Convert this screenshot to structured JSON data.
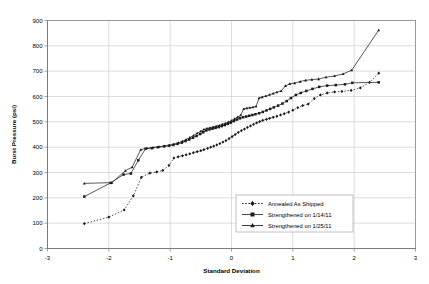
{
  "chart_data": {
    "type": "line",
    "title": "",
    "xlabel": "Standard Deviation",
    "ylabel": "Burst Pressure (psi)",
    "xlim": [
      -3,
      3
    ],
    "ylim": [
      0,
      900
    ],
    "xticks": [
      -3,
      -2,
      -1,
      0,
      1,
      2,
      3
    ],
    "yticks": [
      0,
      100,
      200,
      300,
      400,
      500,
      600,
      700,
      800,
      900
    ],
    "grid": true,
    "legend_position": "lower-center-right",
    "series": [
      {
        "name": "Annealed As Shipped",
        "marker": "diamond",
        "linestyle": "dotted",
        "color": "#1a1a1a",
        "points": [
          [
            -2.4,
            98
          ],
          [
            -2.0,
            124
          ],
          [
            -1.75,
            152
          ],
          [
            -1.6,
            208
          ],
          [
            -1.47,
            281
          ],
          [
            -1.33,
            298
          ],
          [
            -1.22,
            302
          ],
          [
            -1.12,
            308
          ],
          [
            -1.02,
            328
          ],
          [
            -0.94,
            357
          ],
          [
            -0.87,
            362
          ],
          [
            -0.8,
            366
          ],
          [
            -0.74,
            370
          ],
          [
            -0.68,
            374
          ],
          [
            -0.62,
            378
          ],
          [
            -0.56,
            382
          ],
          [
            -0.5,
            386
          ],
          [
            -0.45,
            390
          ],
          [
            -0.39,
            395
          ],
          [
            -0.34,
            400
          ],
          [
            -0.29,
            404
          ],
          [
            -0.24,
            409
          ],
          [
            -0.19,
            414
          ],
          [
            -0.14,
            420
          ],
          [
            -0.09,
            426
          ],
          [
            -0.04,
            434
          ],
          [
            0.01,
            442
          ],
          [
            0.06,
            450
          ],
          [
            0.11,
            458
          ],
          [
            0.16,
            465
          ],
          [
            0.21,
            471
          ],
          [
            0.26,
            478
          ],
          [
            0.31,
            484
          ],
          [
            0.36,
            490
          ],
          [
            0.41,
            496
          ],
          [
            0.46,
            501
          ],
          [
            0.51,
            506
          ],
          [
            0.57,
            510
          ],
          [
            0.62,
            514
          ],
          [
            0.68,
            518
          ],
          [
            0.74,
            522
          ],
          [
            0.8,
            527
          ],
          [
            0.86,
            532
          ],
          [
            0.93,
            538
          ],
          [
            1.0,
            546
          ],
          [
            1.08,
            556
          ],
          [
            1.16,
            564
          ],
          [
            1.25,
            570
          ],
          [
            1.35,
            592
          ],
          [
            1.45,
            606
          ],
          [
            1.56,
            614
          ],
          [
            1.68,
            618
          ],
          [
            1.8,
            620
          ],
          [
            1.95,
            624
          ],
          [
            2.1,
            634
          ],
          [
            2.25,
            656
          ],
          [
            2.4,
            692
          ]
        ]
      },
      {
        "name": "Strengthened on 1/14/11",
        "marker": "square",
        "linestyle": "solid",
        "color": "#3a3a3a",
        "points": [
          [
            -2.4,
            205
          ],
          [
            -1.97,
            259
          ],
          [
            -1.76,
            292
          ],
          [
            -1.64,
            296
          ],
          [
            -1.52,
            348
          ],
          [
            -1.4,
            394
          ],
          [
            -1.3,
            396
          ],
          [
            -1.2,
            400
          ],
          [
            -1.1,
            403
          ],
          [
            -1.02,
            406
          ],
          [
            -0.95,
            409
          ],
          [
            -0.88,
            413
          ],
          [
            -0.81,
            418
          ],
          [
            -0.75,
            424
          ],
          [
            -0.69,
            430
          ],
          [
            -0.63,
            437
          ],
          [
            -0.57,
            444
          ],
          [
            -0.51,
            452
          ],
          [
            -0.46,
            459
          ],
          [
            -0.41,
            466
          ],
          [
            -0.36,
            470
          ],
          [
            -0.31,
            473
          ],
          [
            -0.26,
            476
          ],
          [
            -0.21,
            479
          ],
          [
            -0.16,
            483
          ],
          [
            -0.11,
            487
          ],
          [
            -0.06,
            492
          ],
          [
            -0.01,
            497
          ],
          [
            0.04,
            503
          ],
          [
            0.09,
            509
          ],
          [
            0.14,
            514
          ],
          [
            0.19,
            518
          ],
          [
            0.24,
            521
          ],
          [
            0.29,
            524
          ],
          [
            0.34,
            527
          ],
          [
            0.39,
            530
          ],
          [
            0.45,
            534
          ],
          [
            0.51,
            539
          ],
          [
            0.57,
            545
          ],
          [
            0.63,
            551
          ],
          [
            0.69,
            557
          ],
          [
            0.76,
            564
          ],
          [
            0.83,
            572
          ],
          [
            0.9,
            582
          ],
          [
            0.97,
            594
          ],
          [
            1.05,
            606
          ],
          [
            1.13,
            614
          ],
          [
            1.22,
            622
          ],
          [
            1.32,
            630
          ],
          [
            1.43,
            638
          ],
          [
            1.56,
            643
          ],
          [
            1.7,
            645
          ],
          [
            1.85,
            648
          ],
          [
            1.97,
            654
          ],
          [
            2.4,
            656
          ]
        ]
      },
      {
        "name": "Strengthened on 1/25/11",
        "marker": "triangle",
        "linestyle": "solid",
        "color": "#2a2a2a",
        "points": [
          [
            -2.4,
            257
          ],
          [
            -1.95,
            260
          ],
          [
            -1.73,
            307
          ],
          [
            -1.62,
            321
          ],
          [
            -1.48,
            390
          ],
          [
            -1.38,
            396
          ],
          [
            -1.28,
            399
          ],
          [
            -1.18,
            402
          ],
          [
            -1.09,
            405
          ],
          [
            -1.01,
            408
          ],
          [
            -0.94,
            412
          ],
          [
            -0.87,
            417
          ],
          [
            -0.8,
            423
          ],
          [
            -0.74,
            430
          ],
          [
            -0.68,
            438
          ],
          [
            -0.62,
            446
          ],
          [
            -0.56,
            455
          ],
          [
            -0.5,
            463
          ],
          [
            -0.45,
            470
          ],
          [
            -0.4,
            474
          ],
          [
            -0.35,
            477
          ],
          [
            -0.3,
            480
          ],
          [
            -0.25,
            483
          ],
          [
            -0.2,
            486
          ],
          [
            -0.15,
            490
          ],
          [
            -0.1,
            494
          ],
          [
            -0.05,
            499
          ],
          [
            0.0,
            505
          ],
          [
            0.05,
            512
          ],
          [
            0.1,
            519
          ],
          [
            0.15,
            526
          ],
          [
            0.2,
            551
          ],
          [
            0.25,
            554
          ],
          [
            0.3,
            556
          ],
          [
            0.35,
            558
          ],
          [
            0.4,
            561
          ],
          [
            0.45,
            594
          ],
          [
            0.5,
            598
          ],
          [
            0.56,
            602
          ],
          [
            0.62,
            607
          ],
          [
            0.68,
            612
          ],
          [
            0.74,
            617
          ],
          [
            0.81,
            622
          ],
          [
            0.88,
            642
          ],
          [
            0.95,
            650
          ],
          [
            1.03,
            653
          ],
          [
            1.12,
            659
          ],
          [
            1.21,
            664
          ],
          [
            1.31,
            667
          ],
          [
            1.42,
            669
          ],
          [
            1.54,
            676
          ],
          [
            1.68,
            681
          ],
          [
            1.82,
            689
          ],
          [
            1.96,
            704
          ],
          [
            2.4,
            862
          ]
        ]
      }
    ]
  },
  "legend": {
    "entries": [
      {
        "label": "Annealed As Shipped"
      },
      {
        "label": "Strengthened on 1/14/11"
      },
      {
        "label": "Strengthened on 1/25/11"
      }
    ]
  }
}
